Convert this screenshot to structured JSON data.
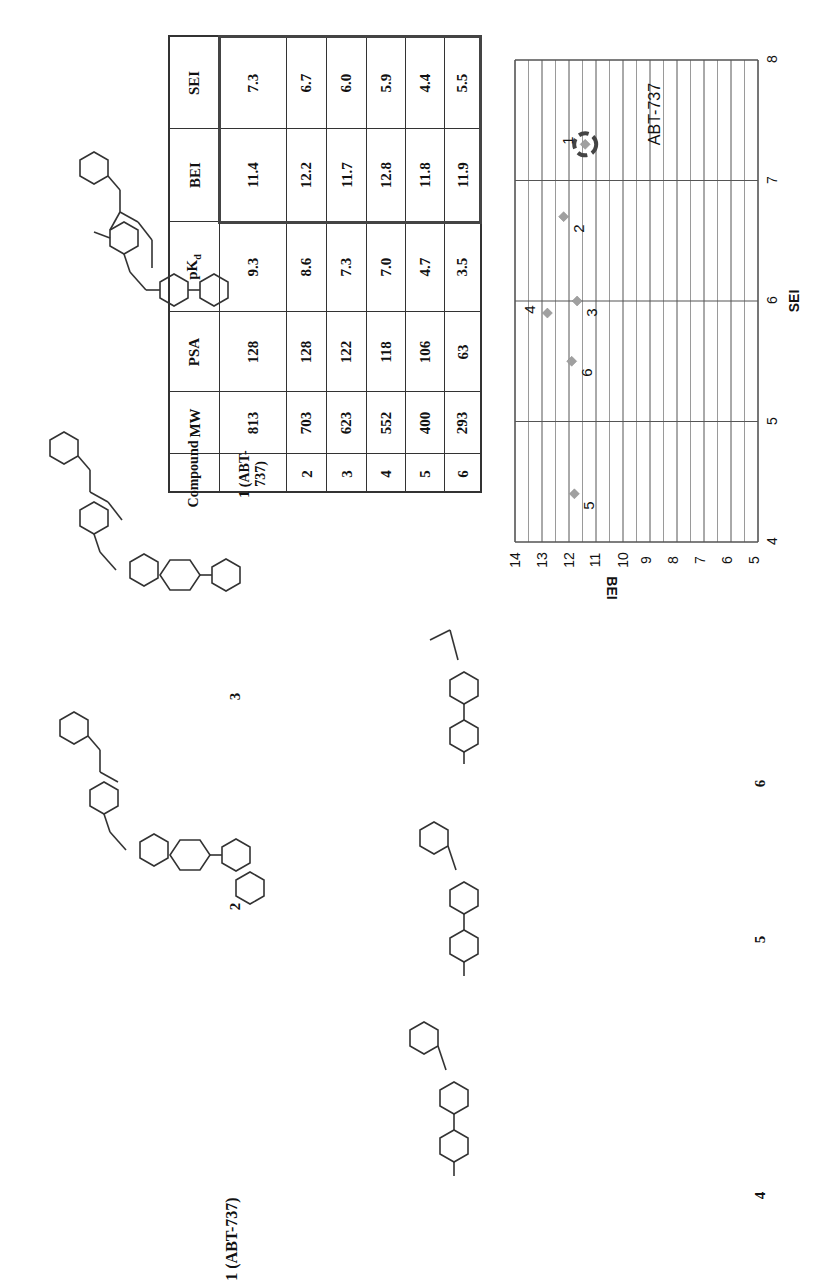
{
  "figure": {
    "orientation": "rotated-90-ccw",
    "compound_labels": [
      "1 (ABT-737)",
      "2",
      "3",
      "4",
      "5",
      "6"
    ]
  },
  "table": {
    "headers": [
      "Compound",
      "MW",
      "PSA",
      "pKd",
      "BEI",
      "SEI"
    ],
    "header_pkd_base": "pK",
    "header_pkd_sub": "d",
    "rows": [
      {
        "compound": "1 (ABT-737)",
        "mw": "813",
        "psa": "128",
        "pkd": "9.3",
        "bei": "11.4",
        "sei": "7.3"
      },
      {
        "compound": "2",
        "mw": "703",
        "psa": "128",
        "pkd": "8.6",
        "bei": "12.2",
        "sei": "6.7"
      },
      {
        "compound": "3",
        "mw": "623",
        "psa": "122",
        "pkd": "7.3",
        "bei": "11.7",
        "sei": "6.0"
      },
      {
        "compound": "4",
        "mw": "552",
        "psa": "118",
        "pkd": "7.0",
        "bei": "12.8",
        "sei": "5.9"
      },
      {
        "compound": "5",
        "mw": "400",
        "psa": "106",
        "pkd": "4.7",
        "bei": "11.8",
        "sei": "4.4"
      },
      {
        "compound": "6",
        "mw": "293",
        "psa": "63",
        "pkd": "3.5",
        "bei": "11.9",
        "sei": "5.5"
      }
    ]
  },
  "chart_data": {
    "type": "scatter",
    "title": "",
    "xlabel": "SEI",
    "ylabel": "BEI",
    "xlim": [
      4,
      8
    ],
    "ylim": [
      5,
      14
    ],
    "x_ticks": [
      "4",
      "5",
      "6",
      "7",
      "8"
    ],
    "y_ticks": [
      "5",
      "6",
      "7",
      "8",
      "9",
      "10",
      "11",
      "12",
      "13",
      "14"
    ],
    "grid": true,
    "marker": "diamond",
    "marker_color": "#a0a0a0",
    "points": [
      {
        "label": "1",
        "x": 7.3,
        "y": 11.4
      },
      {
        "label": "2",
        "x": 6.7,
        "y": 12.2
      },
      {
        "label": "3",
        "x": 6.0,
        "y": 11.7
      },
      {
        "label": "4",
        "x": 5.9,
        "y": 12.8
      },
      {
        "label": "5",
        "x": 4.4,
        "y": 11.8
      },
      {
        "label": "6",
        "x": 5.5,
        "y": 11.9
      }
    ],
    "annotations": [
      {
        "text": "ABT-737",
        "target": "1",
        "style": "dashed circle highlight"
      }
    ]
  },
  "structures": {
    "atom_labels": [
      "N",
      "O",
      "S",
      "F",
      "Cl",
      "N+",
      "O-"
    ]
  }
}
